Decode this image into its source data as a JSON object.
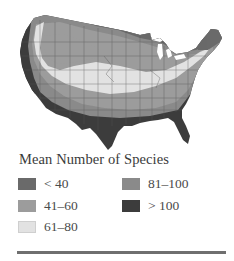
{
  "map": {
    "subject": "Contiguous United States",
    "shading": "grayscale choropleth of mean number of species",
    "colors": {
      "lt40": "#6a6a6a",
      "41_60": "#9c9c9c",
      "61_80": "#e2e2e2",
      "81_100": "#8a8a8a",
      "gt100": "#3c3c3c",
      "state_borders": "#555555"
    }
  },
  "legend": {
    "title": "Mean Number of Species",
    "items": [
      {
        "label": "< 40",
        "color": "#6a6a6a"
      },
      {
        "label": "41–60",
        "color": "#9c9c9c"
      },
      {
        "label": "61–80",
        "color": "#e2e2e2"
      },
      {
        "label": "81–100",
        "color": "#8a8a8a"
      },
      {
        "label": "> 100",
        "color": "#3c3c3c"
      }
    ]
  },
  "divider": {
    "color": "#6f6f6f"
  }
}
